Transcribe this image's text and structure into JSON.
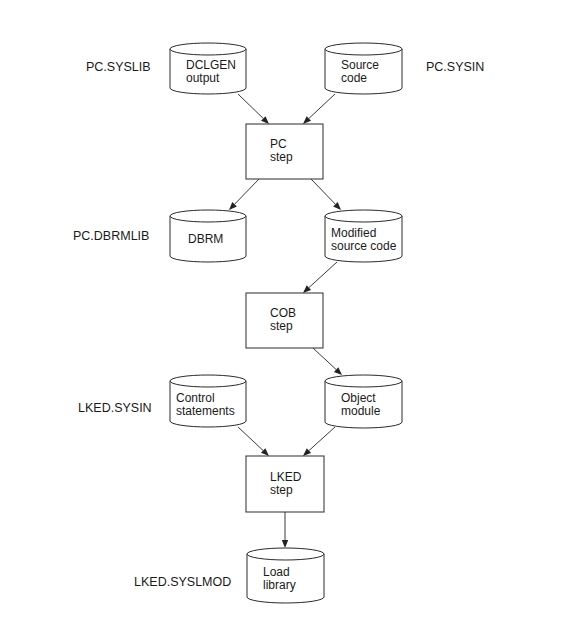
{
  "diagram": {
    "nodes": [
      {
        "id": "dclgen",
        "type": "dataset",
        "lines": [
          "DCLGEN",
          "output"
        ],
        "ddname": "PC.SYSLIB"
      },
      {
        "id": "source",
        "type": "dataset",
        "lines": [
          "Source",
          "code"
        ],
        "ddname": "PC.SYSIN"
      },
      {
        "id": "pcstep",
        "type": "process",
        "lines": [
          "PC",
          "step"
        ]
      },
      {
        "id": "dbrm",
        "type": "dataset",
        "lines": [
          "DBRM"
        ],
        "ddname": "PC.DBRMLIB"
      },
      {
        "id": "modsrc",
        "type": "dataset",
        "lines": [
          "Modified",
          "source code"
        ]
      },
      {
        "id": "cobstep",
        "type": "process",
        "lines": [
          "COB",
          "step"
        ]
      },
      {
        "id": "ctl",
        "type": "dataset",
        "lines": [
          "Control",
          "statements"
        ],
        "ddname": "LKED.SYSIN"
      },
      {
        "id": "obj",
        "type": "dataset",
        "lines": [
          "Object",
          "module"
        ]
      },
      {
        "id": "lkedstep",
        "type": "process",
        "lines": [
          "LKED",
          "step"
        ]
      },
      {
        "id": "loadlib",
        "type": "dataset",
        "lines": [
          "Load",
          "library"
        ],
        "ddname": "LKED.SYSLMOD"
      }
    ],
    "edges": [
      {
        "from": "dclgen",
        "to": "pcstep"
      },
      {
        "from": "source",
        "to": "pcstep"
      },
      {
        "from": "pcstep",
        "to": "dbrm"
      },
      {
        "from": "pcstep",
        "to": "modsrc"
      },
      {
        "from": "modsrc",
        "to": "cobstep"
      },
      {
        "from": "cobstep",
        "to": "obj"
      },
      {
        "from": "ctl",
        "to": "lkedstep"
      },
      {
        "from": "obj",
        "to": "lkedstep"
      },
      {
        "from": "lkedstep",
        "to": "loadlib"
      }
    ]
  }
}
